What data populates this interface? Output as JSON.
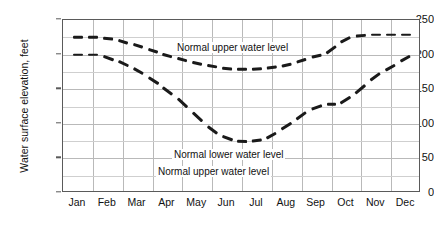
{
  "chart_data": {
    "type": "line",
    "title": "",
    "xlabel": "",
    "ylabel": "Water surface elevation, feet",
    "categories": [
      "Jan",
      "Feb",
      "Mar",
      "Apr",
      "May",
      "Jun",
      "Jul",
      "Aug",
      "Sep",
      "Oct",
      "Nov",
      "Dec"
    ],
    "xlim": [
      0,
      12
    ],
    "ylim": [
      0,
      250
    ],
    "ytick_values": [
      0,
      50,
      100,
      150,
      200,
      250
    ],
    "ytick_labels": [
      "0",
      "50",
      "100",
      "150",
      "200",
      "250"
    ],
    "yminor_step": 25,
    "grid": true,
    "legend": "none",
    "line_style": "dashed",
    "series": [
      {
        "name": "Normal upper water level",
        "values": [
          225,
          224,
          212,
          198,
          185,
          180,
          179,
          180,
          188,
          198,
          228,
          230
        ],
        "points": [
          {
            "x": 0.25,
            "y": 225
          },
          {
            "x": 0.75,
            "y": 225
          },
          {
            "x": 1.25,
            "y": 225
          },
          {
            "x": 1.75,
            "y": 223
          },
          {
            "x": 2.25,
            "y": 216
          },
          {
            "x": 2.75,
            "y": 209
          },
          {
            "x": 3.25,
            "y": 202
          },
          {
            "x": 3.75,
            "y": 196
          },
          {
            "x": 4.25,
            "y": 190
          },
          {
            "x": 4.75,
            "y": 185
          },
          {
            "x": 5.25,
            "y": 181
          },
          {
            "x": 5.75,
            "y": 179
          },
          {
            "x": 6.25,
            "y": 179
          },
          {
            "x": 6.75,
            "y": 180
          },
          {
            "x": 7.25,
            "y": 183
          },
          {
            "x": 7.75,
            "y": 188
          },
          {
            "x": 8.25,
            "y": 195
          },
          {
            "x": 8.75,
            "y": 200
          },
          {
            "x": 9.25,
            "y": 216
          },
          {
            "x": 9.75,
            "y": 227
          },
          {
            "x": 10.25,
            "y": 229
          },
          {
            "x": 10.75,
            "y": 229
          },
          {
            "x": 11.25,
            "y": 229
          },
          {
            "x": 11.75,
            "y": 229
          }
        ]
      },
      {
        "name": "Normal lower water level",
        "values": [
          200,
          200,
          178,
          140,
          100,
          76,
          80,
          103,
          128,
          150,
          178,
          200
        ],
        "points": [
          {
            "x": 0.25,
            "y": 200
          },
          {
            "x": 0.75,
            "y": 200
          },
          {
            "x": 1.25,
            "y": 200
          },
          {
            "x": 1.75,
            "y": 192
          },
          {
            "x": 2.25,
            "y": 182
          },
          {
            "x": 2.75,
            "y": 170
          },
          {
            "x": 3.25,
            "y": 156
          },
          {
            "x": 3.75,
            "y": 140
          },
          {
            "x": 4.25,
            "y": 120
          },
          {
            "x": 4.75,
            "y": 100
          },
          {
            "x": 5.25,
            "y": 84
          },
          {
            "x": 5.75,
            "y": 76
          },
          {
            "x": 6.25,
            "y": 75
          },
          {
            "x": 6.75,
            "y": 78
          },
          {
            "x": 7.25,
            "y": 90
          },
          {
            "x": 7.75,
            "y": 104
          },
          {
            "x": 8.25,
            "y": 120
          },
          {
            "x": 8.75,
            "y": 128
          },
          {
            "x": 9.25,
            "y": 128
          },
          {
            "x": 9.75,
            "y": 142
          },
          {
            "x": 10.25,
            "y": 160
          },
          {
            "x": 10.75,
            "y": 176
          },
          {
            "x": 11.25,
            "y": 188
          },
          {
            "x": 11.75,
            "y": 200
          }
        ]
      }
    ],
    "annotations": [
      {
        "text": "Normal upper water level",
        "x_px": 175,
        "y_px": 42
      },
      {
        "text": "Normal lower water level",
        "x_px": 172,
        "y_px": 149
      },
      {
        "text": "Normal upper water level",
        "x_px": 156,
        "y_px": 166
      }
    ]
  }
}
